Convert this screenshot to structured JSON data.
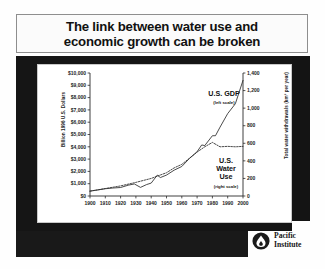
{
  "title": {
    "line1": "The link between water use and",
    "line2": "economic growth can be broken"
  },
  "footer": {
    "org_line1": "Pacific",
    "org_line2": "Institute",
    "logo_icon": "water-drop-circle-icon"
  },
  "labels": {
    "gdp_name": "U.S. GDP",
    "gdp_scale": "(left scale)",
    "water_name_line1": "U.S.",
    "water_name_line2": "Water",
    "water_name_line3": "Use",
    "water_scale": "(right scale)"
  },
  "chart_data": {
    "type": "line",
    "title": "The link between water use and economic growth can be broken",
    "xlabel": "",
    "ylabel": "Billion 1996 U.S. Dollars",
    "y2label": "Total water withdrawals (km³ per year)",
    "xlim": [
      1900,
      2000
    ],
    "ylim": [
      0,
      10000
    ],
    "y2lim": [
      0,
      1400
    ],
    "grid": false,
    "legend": "inline-annotations",
    "xticks": [
      1900,
      1910,
      1920,
      1930,
      1940,
      1950,
      1960,
      1970,
      1980,
      1990,
      2000
    ],
    "xticklabels": [
      "1900",
      "1910",
      "1920",
      "1930",
      "1940",
      "1950",
      "1960",
      "1970",
      "1980",
      "1990",
      "2000"
    ],
    "yticks": [
      0,
      1000,
      2000,
      3000,
      4000,
      5000,
      6000,
      7000,
      8000,
      9000,
      10000
    ],
    "yticklabels": [
      "$0",
      "$1,000",
      "$2,000",
      "$3,000",
      "$4,000",
      "$5,000",
      "$6,000",
      "$7,000",
      "$8,000",
      "$9,000",
      "$10,000"
    ],
    "y2ticks": [
      0,
      200,
      400,
      600,
      800,
      1000,
      1200,
      1400
    ],
    "y2ticklabels": [
      "0",
      "200",
      "400",
      "600",
      "800",
      "1,000",
      "1,200",
      "1,400"
    ],
    "series": [
      {
        "name": "U.S. GDP",
        "axis": "left",
        "style": "solid",
        "units": "Billion 1996 U.S. Dollars",
        "x": [
          1900,
          1905,
          1910,
          1915,
          1920,
          1925,
          1929,
          1933,
          1937,
          1940,
          1944,
          1946,
          1950,
          1955,
          1960,
          1965,
          1970,
          1973,
          1975,
          1980,
          1982,
          1985,
          1990,
          1995,
          2000
        ],
        "y": [
          400,
          490,
          590,
          650,
          690,
          880,
          980,
          700,
          930,
          1050,
          1700,
          1500,
          1700,
          2100,
          2400,
          3050,
          3600,
          4150,
          4100,
          4900,
          4900,
          5600,
          6700,
          7500,
          9400
        ]
      },
      {
        "name": "U.S. Water Use",
        "axis": "right",
        "style": "dotted",
        "units": "km³ per year",
        "x": [
          1900,
          1910,
          1920,
          1930,
          1940,
          1950,
          1955,
          1960,
          1965,
          1970,
          1975,
          1980,
          1985,
          1990,
          1995,
          2000
        ],
        "y": [
          55,
          85,
          115,
          155,
          200,
          265,
          320,
          360,
          430,
          500,
          560,
          610,
          560,
          565,
          560,
          565
        ]
      }
    ]
  }
}
